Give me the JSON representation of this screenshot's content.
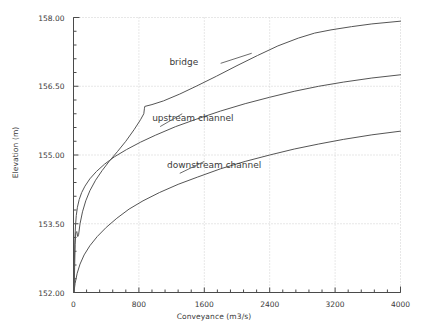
{
  "chart_data": {
    "type": "line",
    "title": "",
    "xlabel": "Conveyance (m3/s)",
    "ylabel": "Elevation (m)",
    "xlim": [
      0,
      4000
    ],
    "ylim": [
      152.0,
      158.0
    ],
    "xticks": [
      0,
      800,
      1600,
      2400,
      3200,
      4000
    ],
    "xtick_labels": [
      "0",
      "800",
      "1600",
      "2400",
      "3200",
      "4000"
    ],
    "yticks": [
      152.0,
      153.5,
      155.0,
      156.5,
      158.0
    ],
    "ytick_labels": [
      "152.00",
      "153.50",
      "155.00",
      "156.50",
      "158.00"
    ],
    "x_minor_per_major": 5,
    "y_minor_per_major": 5,
    "grid": true,
    "grid_style": "dotted",
    "grid_color": "#cfcfcf",
    "line_color": "#555555",
    "legend_position": "inline-annotations",
    "series": [
      {
        "name": "bridge",
        "label_x": 1350,
        "label_y": 157.02,
        "points": [
          [
            8,
            152.02
          ],
          [
            14,
            152.55
          ],
          [
            20,
            153.05
          ],
          [
            28,
            153.3
          ],
          [
            40,
            153.33
          ],
          [
            52,
            153.22
          ],
          [
            62,
            153.26
          ],
          [
            80,
            153.5
          ],
          [
            110,
            153.76
          ],
          [
            150,
            154.0
          ],
          [
            200,
            154.22
          ],
          [
            270,
            154.45
          ],
          [
            350,
            154.66
          ],
          [
            440,
            154.87
          ],
          [
            540,
            155.08
          ],
          [
            640,
            155.3
          ],
          [
            740,
            155.55
          ],
          [
            820,
            155.77
          ],
          [
            860,
            155.9
          ],
          [
            868,
            156.02
          ],
          [
            872,
            156.06
          ],
          [
            960,
            156.1
          ],
          [
            1100,
            156.18
          ],
          [
            1300,
            156.33
          ],
          [
            1500,
            156.5
          ],
          [
            1750,
            156.72
          ],
          [
            2000,
            156.95
          ],
          [
            2250,
            157.17
          ],
          [
            2500,
            157.38
          ],
          [
            2750,
            157.55
          ],
          [
            2950,
            157.66
          ],
          [
            3150,
            157.73
          ],
          [
            3400,
            157.8
          ],
          [
            3650,
            157.86
          ],
          [
            4000,
            157.92
          ]
        ]
      },
      {
        "name": "upstream channel",
        "label_x": 1460,
        "label_y": 155.8,
        "points": [
          [
            6,
            152.02
          ],
          [
            10,
            152.6
          ],
          [
            16,
            153.1
          ],
          [
            24,
            153.45
          ],
          [
            34,
            153.68
          ],
          [
            48,
            153.86
          ],
          [
            70,
            154.03
          ],
          [
            100,
            154.18
          ],
          [
            140,
            154.32
          ],
          [
            200,
            154.48
          ],
          [
            280,
            154.64
          ],
          [
            380,
            154.8
          ],
          [
            500,
            154.96
          ],
          [
            650,
            155.12
          ],
          [
            820,
            155.28
          ],
          [
            1000,
            155.43
          ],
          [
            1250,
            155.62
          ],
          [
            1500,
            155.78
          ],
          [
            1800,
            155.96
          ],
          [
            2100,
            156.12
          ],
          [
            2400,
            156.26
          ],
          [
            2700,
            156.39
          ],
          [
            3000,
            156.5
          ],
          [
            3300,
            156.59
          ],
          [
            3650,
            156.68
          ],
          [
            4000,
            156.75
          ]
        ]
      },
      {
        "name": "downstream channel",
        "label_x": 1720,
        "label_y": 154.78,
        "points": [
          [
            6,
            152.02
          ],
          [
            20,
            152.2
          ],
          [
            45,
            152.42
          ],
          [
            80,
            152.62
          ],
          [
            130,
            152.82
          ],
          [
            200,
            153.02
          ],
          [
            290,
            153.22
          ],
          [
            400,
            153.42
          ],
          [
            530,
            153.62
          ],
          [
            680,
            153.82
          ],
          [
            850,
            154.0
          ],
          [
            1050,
            154.18
          ],
          [
            1280,
            154.36
          ],
          [
            1520,
            154.52
          ],
          [
            1800,
            154.7
          ],
          [
            2100,
            154.86
          ],
          [
            2400,
            155.0
          ],
          [
            2700,
            155.13
          ],
          [
            3000,
            155.24
          ],
          [
            3300,
            155.34
          ],
          [
            3650,
            155.44
          ],
          [
            4000,
            155.52
          ]
        ]
      }
    ]
  },
  "axes": {
    "x_title": "Conveyance (m3/s)",
    "y_title": "Elevation (m)"
  }
}
